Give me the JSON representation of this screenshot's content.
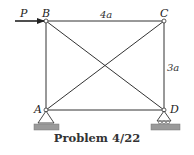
{
  "diagram": {
    "title": "Problem 4/22",
    "joints": [
      {
        "id": "A",
        "label": "A",
        "support": "pin"
      },
      {
        "id": "B",
        "label": "B"
      },
      {
        "id": "C",
        "label": "C"
      },
      {
        "id": "D",
        "label": "D",
        "support": "roller"
      }
    ],
    "members": [
      "AB",
      "BC",
      "CD",
      "AD",
      "AC",
      "BD"
    ],
    "load": {
      "label": "P",
      "joint": "B",
      "direction": "right"
    },
    "dimensions": {
      "width_label": "4a",
      "height_label": "3a"
    },
    "colors": {
      "line": "#333333",
      "ground": "#9a9a9a"
    }
  }
}
